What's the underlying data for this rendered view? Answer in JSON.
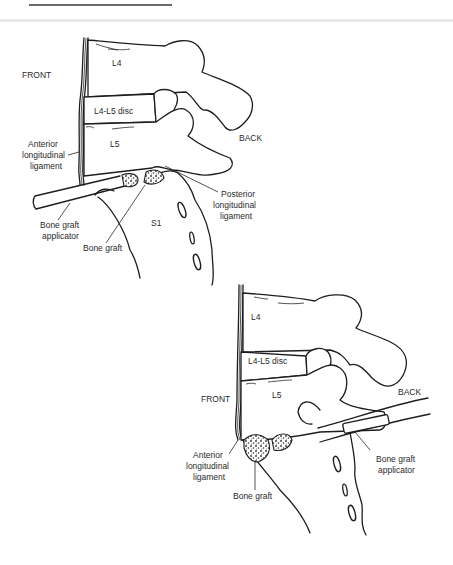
{
  "header": {
    "rule_color": "#6a6a6a",
    "divider_color": "#e2e2e2"
  },
  "figure_top": {
    "labels": {
      "front": "FRONT",
      "back": "BACK",
      "l4": "L4",
      "disc": "L4-L5 disc",
      "l5": "L5",
      "s1": "S1",
      "anterior_ligament": [
        "Anterior",
        "longitudinal",
        "ligament"
      ],
      "posterior_ligament": [
        "Posterior",
        "longitudinal",
        "ligament"
      ],
      "applicator": [
        "Bone graft",
        "applicator"
      ],
      "bone_graft": "Bone graft"
    }
  },
  "figure_bottom": {
    "labels": {
      "front": "FRONT",
      "back": "BACK",
      "l4": "L4",
      "disc": "L4-L5 disc",
      "l5": "L5",
      "anterior_ligament": [
        "Anterior",
        "longitudinal",
        "ligament"
      ],
      "applicator": [
        "Bone graft",
        "applicator"
      ],
      "bone_graft": "Bone graft"
    }
  },
  "colors": {
    "line": "#1e1e1e",
    "text": "#2a2a2a",
    "background": "#ffffff"
  }
}
